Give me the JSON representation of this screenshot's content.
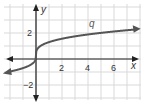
{
  "chart_data": {
    "type": "line",
    "title": "",
    "xlabel": "x",
    "ylabel": "y",
    "series": [
      {
        "name": "q",
        "x": [
          -2.2,
          -1,
          -0.3,
          0,
          0.3,
          1,
          2,
          4,
          6,
          7.8
        ],
        "values": [
          -1.0,
          -0.7,
          -0.37,
          0.3,
          0.97,
          1.3,
          1.56,
          1.89,
          2.12,
          2.28
        ]
      }
    ],
    "xlim": [
      -2.5,
      8
    ],
    "ylim": [
      -3,
      4
    ],
    "xticks": [
      2,
      4,
      6
    ],
    "yticks": [
      2,
      -2
    ],
    "grid": true,
    "curve_label": "q",
    "colors": {
      "curve": "#555555",
      "grid": "#d9d9d9",
      "axis": "#222222"
    }
  }
}
